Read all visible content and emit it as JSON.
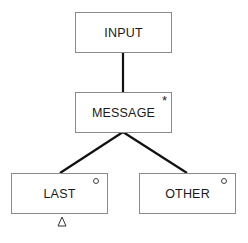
{
  "diagram": {
    "nodes": [
      {
        "id": "input",
        "label": "INPUT",
        "marker": ""
      },
      {
        "id": "message",
        "label": "MESSAGE",
        "marker": "*"
      },
      {
        "id": "last",
        "label": "LAST",
        "marker": "o"
      },
      {
        "id": "other",
        "label": "OTHER",
        "marker": "o"
      }
    ],
    "edges": [
      {
        "from": "input",
        "to": "message"
      },
      {
        "from": "message",
        "to": "last"
      },
      {
        "from": "message",
        "to": "other"
      }
    ],
    "annotations": [
      {
        "node": "last",
        "type": "triangle-below"
      }
    ]
  }
}
